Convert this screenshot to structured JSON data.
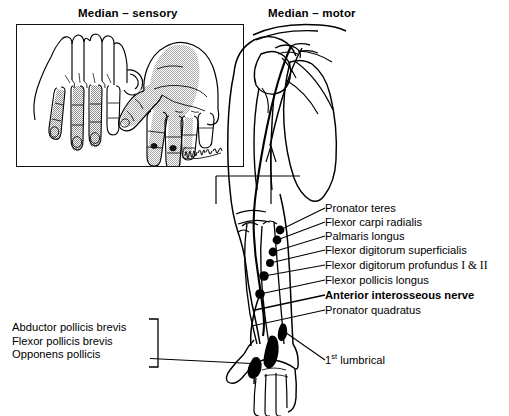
{
  "figure": {
    "panels": {
      "sensory_title": "Median – sensory",
      "motor_title": "Median – motor"
    },
    "artist_signature": "Marlow"
  },
  "sensory_panel": {
    "views": [
      {
        "name": "dorsal-hand",
        "shading": "stippled median sensory territory over dorsal distal digits 2-4 and radial half of digit 4"
      },
      {
        "name": "palmar-hand",
        "shading": "stippled median sensory territory over thumb, index, middle, radial half of ring finger and lateral palm"
      }
    ]
  },
  "motor_panel": {
    "nerve": "median nerve",
    "branch_labels": [
      {
        "id": "pronator-teres",
        "text": "Pronator teres",
        "bold": false,
        "top": 203
      },
      {
        "id": "flexor-carpi-radialis",
        "text": "Flexor carpi radialis",
        "bold": false,
        "top": 217
      },
      {
        "id": "palmaris-longus",
        "text": "Palmaris longus",
        "bold": false,
        "top": 231
      },
      {
        "id": "flexor-digitorum-superficialis",
        "text": "Flexor digitorum superficialis",
        "bold": false,
        "top": 245
      },
      {
        "id": "flexor-digitorum-profundus",
        "text": "Flexor digitorum profundus I & II",
        "bold": false,
        "top": 260,
        "roman": "I & II"
      },
      {
        "id": "flexor-pollicis-longus",
        "text": "Flexor pollicis longus",
        "bold": false,
        "top": 275
      },
      {
        "id": "anterior-interosseous-nerve",
        "text": "Anterior interosseous nerve",
        "bold": true,
        "top": 290
      },
      {
        "id": "pronator-quadratus",
        "text": "Pronator quadratus",
        "bold": false,
        "top": 305
      }
    ],
    "thenar_group": {
      "items": [
        "Abductor pollicis brevis",
        "Flexor pollicis brevis",
        "Opponens pollicis"
      ]
    },
    "lumbrical_label": {
      "prefix": "1",
      "suffix": "st",
      "text": " lumbrical"
    }
  },
  "colors": {
    "ink": "#000000",
    "paper": "#ffffff",
    "stipple": "#9a9a9a",
    "muscle_fill": "#000000"
  }
}
